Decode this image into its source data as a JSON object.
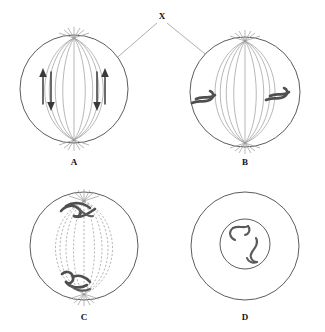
{
  "figure": {
    "callout": {
      "label": "X",
      "points_to": "spindle-fibers"
    },
    "colors": {
      "outline": "#4a4a4a",
      "spindle": "#9a9a9a",
      "chromosome": "#4f4f4f",
      "arrow": "#3a3a3a",
      "background": "#ffffff",
      "text": "#111111"
    },
    "panels": [
      {
        "id": "A",
        "label": "A",
        "cell": {
          "cx": 74,
          "cy": 89,
          "r": 54
        },
        "spindle_style": "solid",
        "spindle_fiber_count": 9,
        "has_asters": true,
        "chromosomes": [],
        "arrows": [
          {
            "name": "left-up-arrow",
            "x": 43,
            "y1": 100,
            "y2": 72,
            "direction": "up"
          },
          {
            "name": "left-down-arrow",
            "x": 49,
            "y1": 72,
            "y2": 110,
            "direction": "down"
          },
          {
            "name": "right-up-arrow",
            "x": 104,
            "y1": 100,
            "y2": 72,
            "direction": "up"
          },
          {
            "name": "right-down-arrow",
            "x": 98,
            "y1": 72,
            "y2": 110,
            "direction": "down"
          }
        ]
      },
      {
        "id": "B",
        "label": "B",
        "cell": {
          "cx": 245,
          "cy": 92,
          "r": 55
        },
        "spindle_style": "solid",
        "spindle_fiber_count": 9,
        "has_asters": true,
        "chromosomes": [
          {
            "name": "chromosome-left",
            "cx": 208,
            "cy": 98
          },
          {
            "name": "chromosome-right",
            "cx": 281,
            "cy": 95
          }
        ],
        "arrows": []
      },
      {
        "id": "C",
        "label": "C",
        "cell": {
          "cx": 84,
          "cy": 246,
          "r": 54
        },
        "spindle_style": "dashed",
        "spindle_fiber_count": 9,
        "has_asters": true,
        "chromosomes": [
          {
            "name": "chromosome-top",
            "cx": 77,
            "cy": 209
          },
          {
            "name": "chromosome-bottom",
            "cx": 76,
            "cy": 283
          }
        ],
        "arrows": []
      },
      {
        "id": "D",
        "label": "D",
        "cell": {
          "cx": 245,
          "cy": 246,
          "r": 54
        },
        "nucleus": {
          "cx": 245,
          "cy": 244,
          "r": 25
        },
        "spindle_style": "none",
        "spindle_fiber_count": 0,
        "has_asters": false,
        "chromosomes": [
          {
            "name": "chromosome-upper",
            "cx": 237,
            "cy": 233
          },
          {
            "name": "chromosome-lower",
            "cx": 253,
            "cy": 252
          }
        ],
        "arrows": []
      }
    ]
  }
}
